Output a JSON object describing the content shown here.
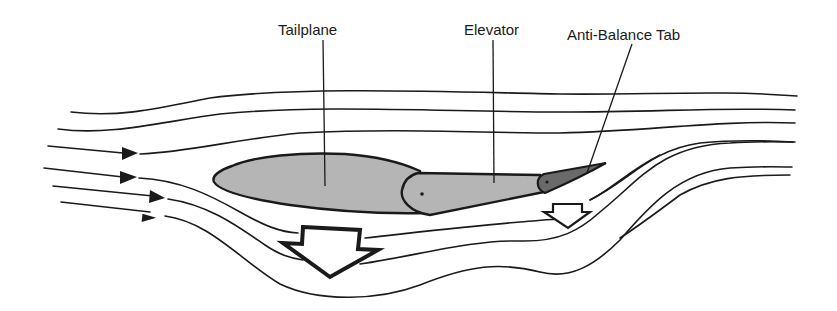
{
  "diagram": {
    "labels": {
      "tailplane": "Tailplane",
      "elevator": "Elevator",
      "anti_balance_tab": "Anti-Balance Tab"
    },
    "colors": {
      "surface_fill": "#b5b5b5",
      "tab_fill": "#6a6a6a",
      "outline": "#1a1a1a",
      "background": "#ffffff"
    },
    "force_arrows": [
      {
        "name": "tailplane-force",
        "direction": "down",
        "size": "large"
      },
      {
        "name": "tab-force",
        "direction": "down",
        "size": "small"
      }
    ],
    "airflow": {
      "direction": "left-to-right",
      "streamline_count": 9,
      "arrowheads": 4
    }
  }
}
